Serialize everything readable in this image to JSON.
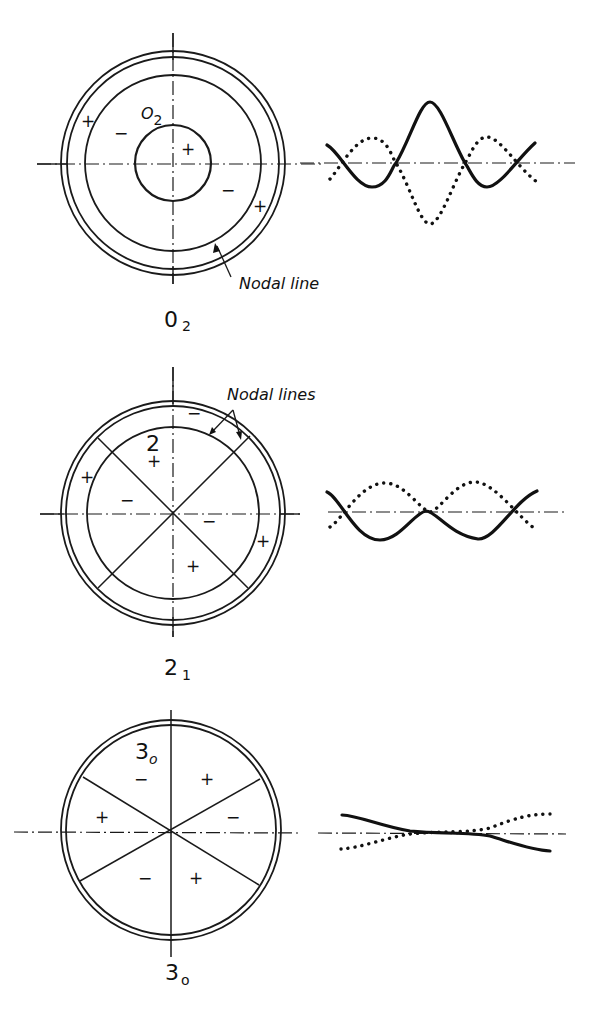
{
  "figure": {
    "panels": [
      {
        "id": "mode-02",
        "caption_main": "0",
        "caption_sub": "2",
        "inner_label_main": "O",
        "inner_label_sub": "2",
        "annotation": "Nodal line",
        "signs": [
          "+",
          "−",
          "+",
          "−",
          "+"
        ],
        "profile": {
          "solid": "solid-curve",
          "dotted": "dotted-curve"
        }
      },
      {
        "id": "mode-21",
        "caption_main": "2",
        "caption_sub": "1",
        "inner_label_main": "2",
        "annotation": "Nodal lines",
        "signs": [
          "−",
          "+",
          "+",
          "−",
          "−",
          "+",
          "+"
        ],
        "profile": {
          "solid": "solid-curve",
          "dotted": "dotted-curve"
        }
      },
      {
        "id": "mode-30",
        "caption_main": "3",
        "caption_sub": "o",
        "inner_label_main": "3",
        "inner_label_sub": "o",
        "signs": [
          "−",
          "+",
          "+",
          "−",
          "−",
          "+"
        ],
        "profile": {
          "solid": "solid-curve",
          "dotted": "dotted-curve"
        }
      }
    ]
  }
}
